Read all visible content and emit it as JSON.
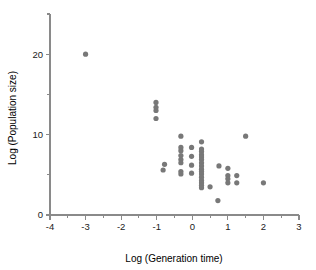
{
  "chart_data": {
    "type": "scatter",
    "title": "",
    "xlabel": "Log (Generation time)",
    "ylabel": "Log (Population size)",
    "xlim": [
      -4,
      3
    ],
    "ylim": [
      0,
      25
    ],
    "grid": false,
    "legend": null,
    "xticks": [
      -4,
      -3,
      -2,
      -1,
      0,
      1,
      2,
      3
    ],
    "xtick_labels": [
      "-4",
      "-3",
      "-2",
      "-1",
      "0",
      "1",
      "2",
      "3"
    ],
    "xminorticks": [
      -3.5,
      -2.5,
      -1.5,
      -0.5,
      0.5,
      1.5,
      2.5
    ],
    "yticks": [
      0,
      5,
      10,
      15,
      20,
      25
    ],
    "ytick_labels": [
      "0",
      "",
      "10",
      "",
      "20",
      ""
    ],
    "marker": {
      "shape": "circle",
      "color": "#787878",
      "size": 2.6
    },
    "points": [
      {
        "x": -3.0,
        "y": 20.0
      },
      {
        "x": -1.02,
        "y": 14.0
      },
      {
        "x": -1.02,
        "y": 13.4
      },
      {
        "x": -1.02,
        "y": 13.0
      },
      {
        "x": -1.02,
        "y": 12.0
      },
      {
        "x": -0.78,
        "y": 6.3
      },
      {
        "x": -0.82,
        "y": 5.6
      },
      {
        "x": -0.32,
        "y": 9.8
      },
      {
        "x": -0.32,
        "y": 8.4
      },
      {
        "x": -0.32,
        "y": 8.0
      },
      {
        "x": -0.32,
        "y": 7.4
      },
      {
        "x": -0.32,
        "y": 6.9
      },
      {
        "x": -0.32,
        "y": 6.5
      },
      {
        "x": -0.32,
        "y": 5.4
      },
      {
        "x": -0.32,
        "y": 5.1
      },
      {
        "x": -0.02,
        "y": 8.4
      },
      {
        "x": -0.02,
        "y": 7.3
      },
      {
        "x": -0.02,
        "y": 6.2
      },
      {
        "x": -0.02,
        "y": 5.2
      },
      {
        "x": 0.26,
        "y": 9.1
      },
      {
        "x": 0.26,
        "y": 8.2
      },
      {
        "x": 0.26,
        "y": 7.9
      },
      {
        "x": 0.26,
        "y": 7.5
      },
      {
        "x": 0.26,
        "y": 7.2
      },
      {
        "x": 0.26,
        "y": 6.9
      },
      {
        "x": 0.26,
        "y": 6.5
      },
      {
        "x": 0.26,
        "y": 6.1
      },
      {
        "x": 0.26,
        "y": 5.7
      },
      {
        "x": 0.26,
        "y": 5.4
      },
      {
        "x": 0.26,
        "y": 5.1
      },
      {
        "x": 0.26,
        "y": 4.7
      },
      {
        "x": 0.26,
        "y": 4.3
      },
      {
        "x": 0.26,
        "y": 4.0
      },
      {
        "x": 0.26,
        "y": 3.7
      },
      {
        "x": 0.26,
        "y": 3.4
      },
      {
        "x": 0.5,
        "y": 3.5
      },
      {
        "x": 0.72,
        "y": 1.8
      },
      {
        "x": 0.75,
        "y": 6.1
      },
      {
        "x": 1.0,
        "y": 5.8
      },
      {
        "x": 1.0,
        "y": 4.9
      },
      {
        "x": 1.0,
        "y": 4.5
      },
      {
        "x": 1.0,
        "y": 4.0
      },
      {
        "x": 1.25,
        "y": 4.9
      },
      {
        "x": 1.25,
        "y": 4.0
      },
      {
        "x": 1.5,
        "y": 9.8
      },
      {
        "x": 2.0,
        "y": 4.0
      }
    ]
  },
  "colors": {
    "marker": "#787878",
    "axis": "#8a8a8a",
    "text": "#1a1a1a",
    "background": "#ffffff"
  }
}
